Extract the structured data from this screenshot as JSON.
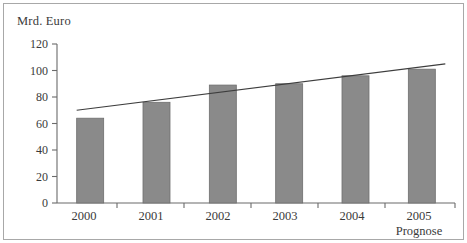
{
  "chart_data": {
    "type": "bar",
    "title": "",
    "subtitle": "",
    "xlabel": "",
    "ylabel": "Mrd. Euro",
    "categories": [
      "2000",
      "2001",
      "2002",
      "2003",
      "2004",
      "2005"
    ],
    "values": [
      64,
      76,
      89,
      90,
      96,
      101
    ],
    "series": [
      {
        "name": "Mrd. Euro",
        "type": "bar",
        "values": [
          64,
          76,
          89,
          90,
          96,
          101
        ]
      },
      {
        "name": "Trendlinie",
        "type": "line",
        "x": [
          "2000",
          "2005"
        ],
        "values": [
          70,
          105
        ]
      }
    ],
    "annotations": [
      {
        "text": "Prognose",
        "category": "2005",
        "position": "below-axis"
      }
    ],
    "yticks": [
      0,
      20,
      40,
      60,
      80,
      100,
      120
    ],
    "ylim": [
      0,
      120
    ],
    "grid": false,
    "legend": false,
    "legend_position": "none",
    "bar_color": "#8a8a8a",
    "bar_edge_color": "#6e6e6e",
    "trendline_color": "#3d3d3d",
    "axis_color": "#6b6b6b",
    "text_color": "#3a3a3a",
    "background_color": "#ffffff",
    "border_color": "#a8a8a8"
  },
  "axis": {
    "y_title": "Mrd. Euro",
    "y_tick_labels": [
      "120",
      "100",
      "80",
      "60",
      "40",
      "20",
      "0"
    ],
    "x_tick_labels": [
      "2000",
      "2001",
      "2002",
      "2003",
      "2004",
      "2005"
    ]
  },
  "notes": {
    "prognose": "Prognose"
  }
}
